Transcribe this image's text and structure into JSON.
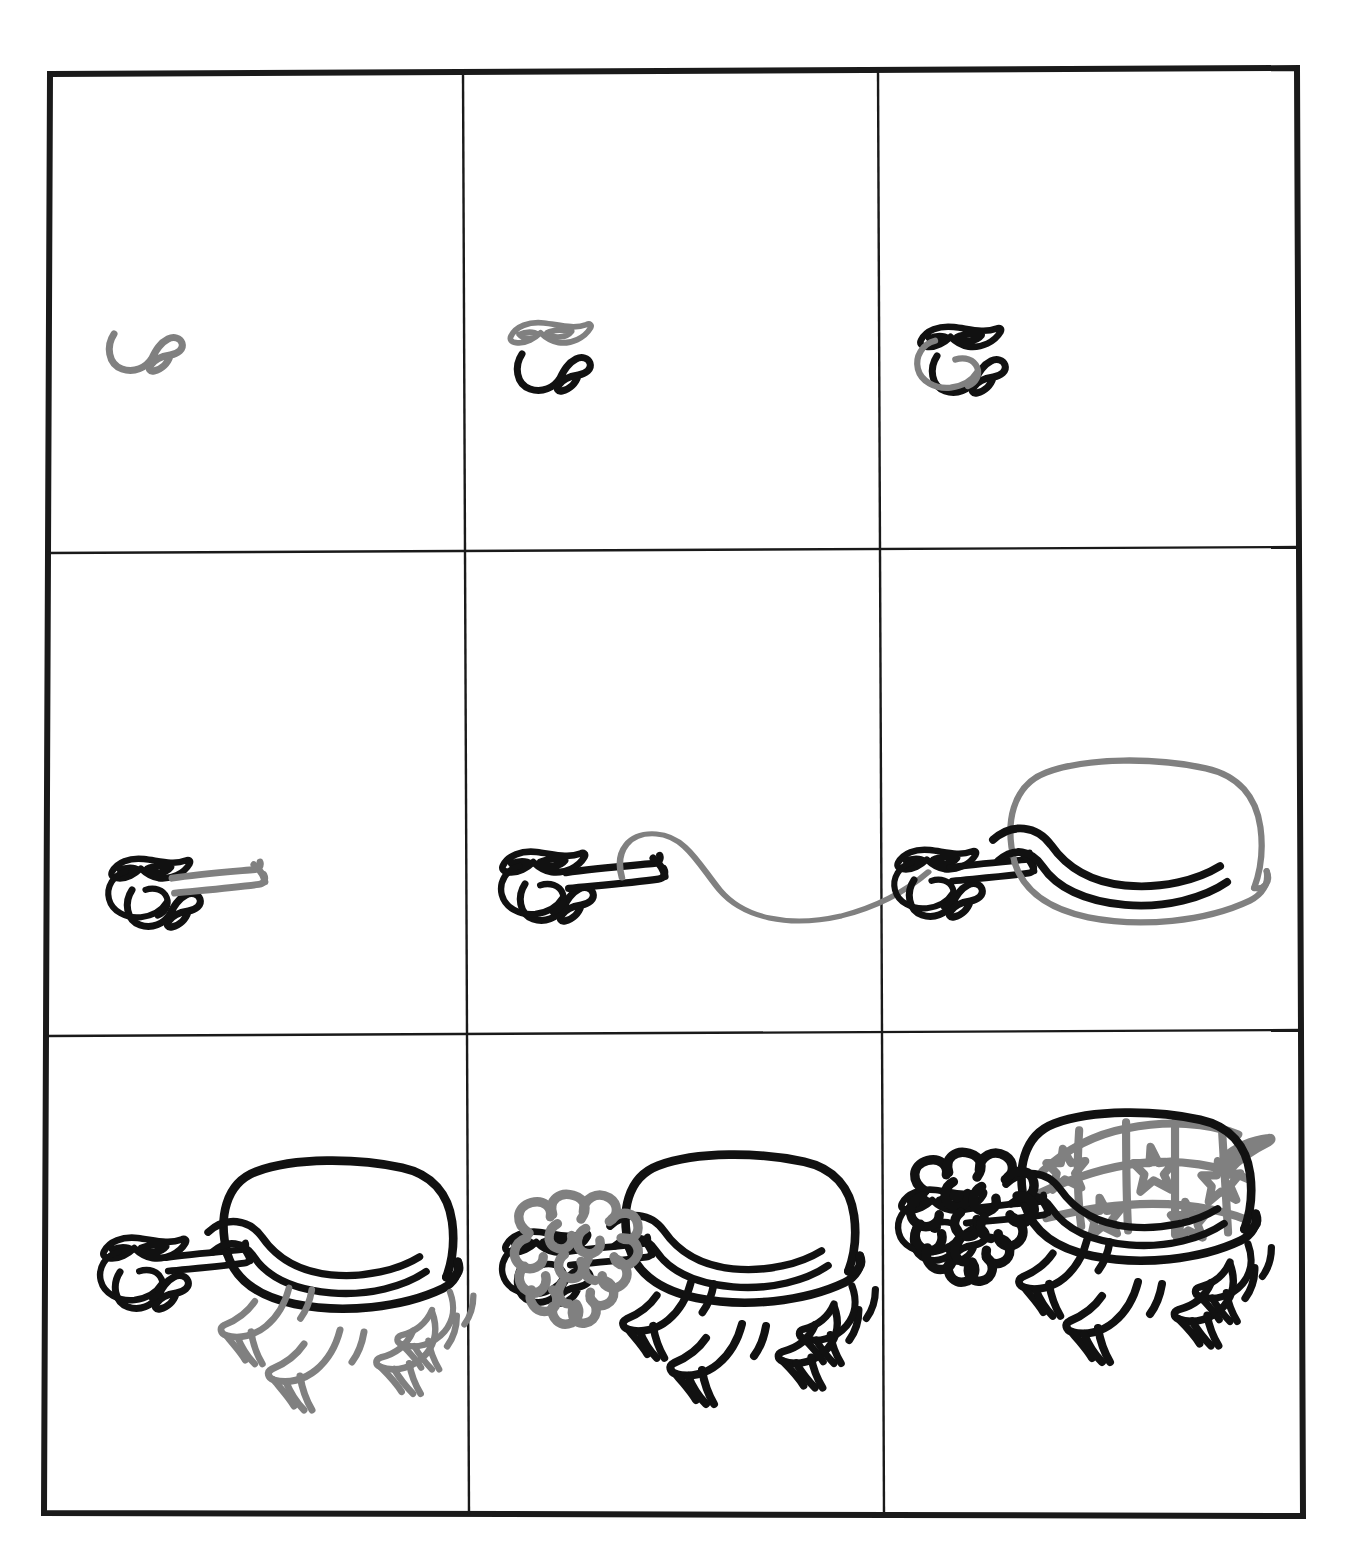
{
  "page": {
    "background_color": "#ffffff",
    "frame": {
      "border_color": "#1a1a1a",
      "outer_border_width_px": 5,
      "inner_line_width_px": 2,
      "left": 50,
      "top": 68,
      "right": 1297,
      "bottom": 1516,
      "columns": 3,
      "rows": 3,
      "col_dividers_x": [
        461,
        876
      ],
      "row_dividers_y": [
        551,
        1033
      ]
    },
    "ink": {
      "established_stroke_color": "#111111",
      "new_stroke_color": "#808080",
      "pattern_color": "#8a8a8a"
    }
  },
  "tutorial": {
    "subject": "turtle",
    "step_count": 9,
    "steps": [
      {
        "number": 1,
        "row": 1,
        "column": 1,
        "new_part": "snout-and-mouth",
        "description": "A small hooked curve forming the snout and open mouth",
        "parts_present": [
          "snout"
        ],
        "new_parts": [
          "snout"
        ]
      },
      {
        "number": 2,
        "row": 1,
        "column": 2,
        "new_part": "sunglasses",
        "description": "Pointed cat-eye sunglasses added above the snout",
        "parts_present": [
          "snout",
          "sunglasses"
        ],
        "new_parts": [
          "sunglasses"
        ]
      },
      {
        "number": 3,
        "row": 1,
        "column": 3,
        "new_part": "head-outline",
        "description": "The rounded back of the head and jaw closing the face",
        "parts_present": [
          "snout",
          "sunglasses",
          "head"
        ],
        "new_parts": [
          "head"
        ]
      },
      {
        "number": 4,
        "row": 2,
        "column": 1,
        "new_part": "neck",
        "description": "A long neck stretching out to the right with a flared end",
        "parts_present": [
          "snout",
          "sunglasses",
          "head",
          "neck"
        ],
        "new_parts": [
          "neck"
        ]
      },
      {
        "number": 5,
        "row": 2,
        "column": 2,
        "new_part": "shell-top-line",
        "description": "A long sweeping guide curve for the top of the shell",
        "parts_present": [
          "snout",
          "sunglasses",
          "head",
          "neck",
          "shell-guide"
        ],
        "new_parts": [
          "shell-guide"
        ]
      },
      {
        "number": 6,
        "row": 2,
        "column": 3,
        "new_part": "shell",
        "description": "The dome of the shell closed off with its lower rim",
        "parts_present": [
          "snout",
          "sunglasses",
          "head",
          "neck",
          "shell"
        ],
        "new_parts": [
          "shell"
        ]
      },
      {
        "number": 7,
        "row": 3,
        "column": 1,
        "new_part": "legs",
        "description": "Four legs with splayed clawed feet under the shell",
        "parts_present": [
          "snout",
          "sunglasses",
          "head",
          "neck",
          "shell",
          "legs"
        ],
        "new_parts": [
          "legs"
        ]
      },
      {
        "number": 8,
        "row": 3,
        "column": 2,
        "new_part": "curly-hair",
        "description": "A big curly mane of hair around the head and neck",
        "parts_present": [
          "snout",
          "sunglasses",
          "head",
          "neck",
          "shell",
          "legs",
          "hair"
        ],
        "new_parts": [
          "hair"
        ]
      },
      {
        "number": 9,
        "row": 3,
        "column": 3,
        "new_part": "shell-star-pattern-eye-and-tail",
        "description": "Star patterning on the shell plus the eye and a short tail",
        "parts_present": [
          "snout",
          "sunglasses",
          "head",
          "eye",
          "neck",
          "shell",
          "shell-pattern",
          "legs",
          "hair",
          "tail"
        ],
        "new_parts": [
          "shell-pattern",
          "eye",
          "tail"
        ]
      }
    ]
  }
}
